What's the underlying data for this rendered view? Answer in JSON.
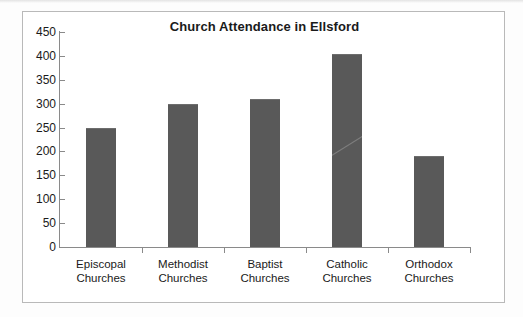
{
  "chart_data": {
    "type": "bar",
    "title": "Church Attendance in Ellsford",
    "xlabel": "",
    "ylabel": "",
    "categories": [
      "Episcopal Churches",
      "Methodist Churches",
      "Baptist Churches",
      "Catholic Churches",
      "Orthodox Churches"
    ],
    "category_lines": [
      [
        "Episcopal",
        "Churches"
      ],
      [
        "Methodist",
        "Churches"
      ],
      [
        "Baptist",
        "Churches"
      ],
      [
        "Catholic",
        "Churches"
      ],
      [
        "Orthodox",
        "Churches"
      ]
    ],
    "values": [
      250,
      300,
      310,
      405,
      190
    ],
    "ylim": [
      0,
      450
    ],
    "ytick_step": 50,
    "yticks": [
      450,
      400,
      350,
      300,
      250,
      200,
      150,
      100,
      50,
      0
    ],
    "ytick_labels": [
      "450",
      "400",
      "350",
      "300",
      "250",
      "200",
      "150",
      "100",
      "50",
      "0"
    ],
    "grid": false,
    "legend": false,
    "legend_position": "none",
    "bar_color": "#595959",
    "axis_color": "#8a8a8a",
    "title_color": "#1a1a1a",
    "plot_background": "#ffffff",
    "frame_color": "#b9b9b9"
  }
}
